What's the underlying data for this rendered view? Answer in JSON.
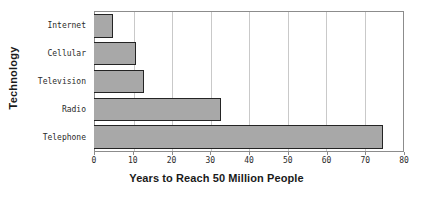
{
  "chart_data": {
    "type": "bar",
    "orientation": "horizontal",
    "title": "",
    "xlabel": "Years to Reach 50 Million People",
    "ylabel": "Technology",
    "categories": [
      "Internet",
      "Cellular",
      "Television",
      "Radio",
      "Telephone"
    ],
    "values": [
      5,
      11,
      13,
      33,
      75
    ],
    "xlim": [
      0,
      80
    ],
    "xticks": [
      0,
      10,
      20,
      30,
      40,
      50,
      60,
      70,
      80
    ],
    "xtick_labels": [
      "0",
      "10",
      "20",
      "30",
      "40",
      "50",
      "60",
      "70",
      "80"
    ],
    "grid": "vertical",
    "legend": "none",
    "bar_fill_color": "#a8a8a8",
    "bar_edge_color": "#242424",
    "gridline_color": "#c9c9c9",
    "axis_color": "#8c8c8c",
    "background_color": "#ffffff"
  }
}
